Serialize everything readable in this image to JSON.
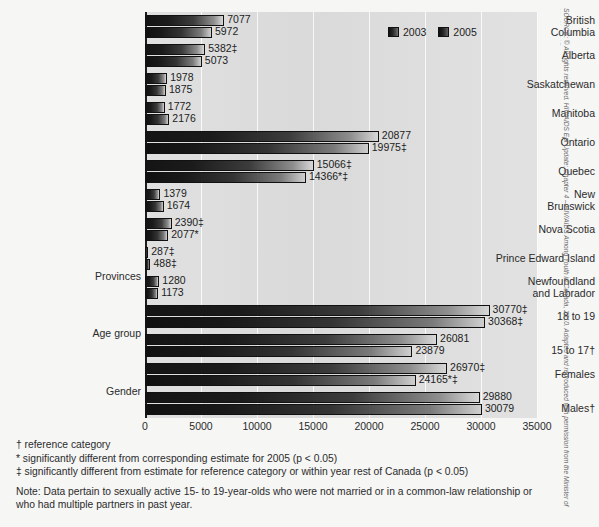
{
  "legend": {
    "entries": [
      {
        "label": "2003",
        "color": "#1c1c1c"
      },
      {
        "label": "2005",
        "color": "#141414"
      }
    ]
  },
  "footnotes": {
    "line1": "† reference category",
    "line2": "* significantly different from corresponding estimate for 2005 (p < 0.05)",
    "line3": "‡ significantly different from estimate for reference category or within year rest of Canada (p < 0.05)",
    "note": "Note: Data pertain to sexually active 15- to 19-year-olds who were not married or in a common-law relationship or who had multiple partners in past year."
  },
  "source": {
    "text": "SOURCE: © All rights reserved. HIV/AIDS Epi Update: Chapter 4 – HIV/AIDS Among Youth in Canada, 2010. Adapted and reproduced with permission from the Minister of Health, 2015."
  },
  "group_labels": {
    "provinces": "Provinces",
    "age_group": "Age group",
    "gender": "Gender"
  },
  "chart_data": {
    "type": "bar",
    "orientation": "horizontal",
    "title": "",
    "xlabel": "",
    "ylabel": "",
    "xlim": [
      0,
      35000
    ],
    "xticks": [
      0,
      5000,
      10000,
      15000,
      20000,
      25000,
      30000,
      35000
    ],
    "xtick_labels": [
      "0",
      "5000",
      "10000",
      "15000",
      "20000",
      "25000",
      "30000",
      "35000"
    ],
    "grid": "vertical",
    "legend_position": "top-right",
    "series": [
      {
        "name": "2003"
      },
      {
        "name": "2005"
      }
    ],
    "categories": [
      "British Columbia",
      "Alberta",
      "Saskatchewan",
      "Manitoba",
      "Ontario",
      "Quebec",
      "New Brunswick",
      "Nova Scotia",
      "Prince Edward Island",
      "Newfoundland and Labrador",
      "18 to 19",
      "15 to 17†",
      "Females",
      "Males†"
    ],
    "rows": [
      {
        "label_lines": [
          "British",
          "Columbia"
        ],
        "group": "Provinces",
        "v2003": 7077,
        "v2005": 5972,
        "label2003": "7077",
        "label2005": "5972"
      },
      {
        "label_lines": [
          "Alberta"
        ],
        "group": "Provinces",
        "v2003": 5382,
        "v2005": 5073,
        "label2003": "5382‡",
        "label2005": "5073"
      },
      {
        "label_lines": [
          "Saskatchewan"
        ],
        "group": "Provinces",
        "v2003": 1978,
        "v2005": 1875,
        "label2003": "1978",
        "label2005": "1875"
      },
      {
        "label_lines": [
          "Manitoba"
        ],
        "group": "Provinces",
        "v2003": 1772,
        "v2005": 2176,
        "label2003": "1772",
        "label2005": "2176"
      },
      {
        "label_lines": [
          "Ontario"
        ],
        "group": "Provinces",
        "v2003": 20877,
        "v2005": 19975,
        "label2003": "20877",
        "label2005": "19975‡"
      },
      {
        "label_lines": [
          "Quebec"
        ],
        "group": "Provinces",
        "v2003": 15066,
        "v2005": 14366,
        "label2003": "15066‡",
        "label2005": "14366*‡"
      },
      {
        "label_lines": [
          "New",
          "Brunswick"
        ],
        "group": "Provinces",
        "v2003": 1379,
        "v2005": 1674,
        "label2003": "1379",
        "label2005": "1674"
      },
      {
        "label_lines": [
          "Nova Scotia"
        ],
        "group": "Provinces",
        "v2003": 2390,
        "v2005": 2077,
        "label2003": "2390‡",
        "label2005": "2077*"
      },
      {
        "label_lines": [
          "Prince Edward Island"
        ],
        "group": "Provinces",
        "v2003": 287,
        "v2005": 488,
        "label2003": "287‡",
        "label2005": "488‡"
      },
      {
        "label_lines": [
          "Newfoundland",
          "and Labrador"
        ],
        "group": "Provinces",
        "v2003": 1280,
        "v2005": 1173,
        "label2003": "1280",
        "label2005": "1173"
      },
      {
        "label_lines": [
          "18 to 19"
        ],
        "group": "Age group",
        "v2003": 30770,
        "v2005": 30368,
        "label2003": "30770‡",
        "label2005": "30368‡"
      },
      {
        "label_lines": [
          "15 to 17†"
        ],
        "group": "Age group",
        "v2003": 26081,
        "v2005": 23879,
        "label2003": "26081",
        "label2005": "23879"
      },
      {
        "label_lines": [
          "Females"
        ],
        "group": "Gender",
        "v2003": 26970,
        "v2005": 24165,
        "label2003": "26970‡",
        "label2005": "24165*‡"
      },
      {
        "label_lines": [
          "Males†"
        ],
        "group": "Gender",
        "v2003": 29880,
        "v2005": 30079,
        "label2003": "29880",
        "label2005": "30079"
      }
    ]
  }
}
